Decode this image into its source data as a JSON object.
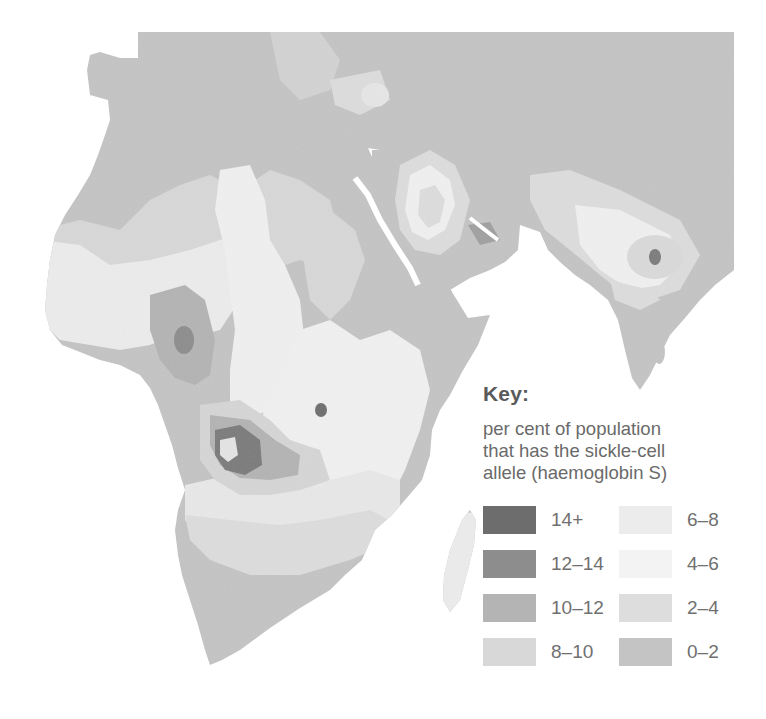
{
  "map": {
    "subject": "Distribution of the sickle-cell allele (haemoglobin S) in Africa, the Mediterranean, Middle East and India",
    "colors": {
      "14+": "#6d6d6d",
      "12-14": "#8d8d8d",
      "10-12": "#b4b4b4",
      "8-10": "#d8d8d8",
      "6-8": "#ececec",
      "4-6": "#f3f3f3",
      "2-4": "#dddddd",
      "0-2": "#c4c4c4",
      "sea": "#ffffff"
    }
  },
  "key": {
    "title": "Key:",
    "description_lines": [
      "per cent of population",
      "that has the sickle-cell",
      "allele (haemoglobin S)"
    ],
    "items": [
      {
        "label": "14+",
        "color": "#6d6d6d"
      },
      {
        "label": "6–8",
        "color": "#ececec"
      },
      {
        "label": "12–14",
        "color": "#8d8d8d"
      },
      {
        "label": "4–6",
        "color": "#f3f3f3"
      },
      {
        "label": "10–12",
        "color": "#b4b4b4"
      },
      {
        "label": "2–4",
        "color": "#dddddd"
      },
      {
        "label": "8–10",
        "color": "#d8d8d8"
      },
      {
        "label": "0–2",
        "color": "#c4c4c4"
      }
    ]
  }
}
